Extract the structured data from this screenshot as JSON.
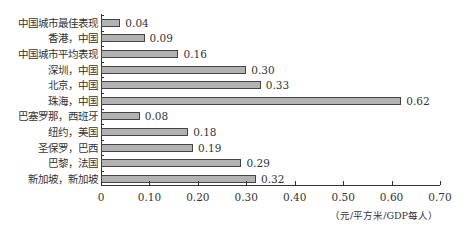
{
  "chart_data": {
    "type": "bar",
    "orientation": "horizontal",
    "title": "",
    "xlabel": "（元/平方米/GDP每人）",
    "ylabel": "",
    "xlim": [
      0,
      0.7
    ],
    "xticks": [
      "0",
      "0.10",
      "0.20",
      "0.30",
      "0.40",
      "0.50",
      "0.60",
      "0.70"
    ],
    "grid": false,
    "legend": null,
    "categories": [
      "中国城市最佳表现",
      "香港，中国",
      "中国城市平均表现",
      "深圳，中国",
      "北京，中国",
      "珠海，中国",
      "巴塞罗那，西班牙",
      "纽约，美国",
      "圣保罗，巴西",
      "巴黎，法国",
      "新加坡，新加坡"
    ],
    "values": [
      0.04,
      0.09,
      0.16,
      0.3,
      0.33,
      0.62,
      0.08,
      0.18,
      0.19,
      0.29,
      0.32
    ],
    "value_labels": [
      "0.04",
      "0.09",
      "0.16",
      "0.30",
      "0.33",
      "0.62",
      "0.08",
      "0.18",
      "0.19",
      "0.29",
      "0.32"
    ],
    "bar_color": "#b2b2b2",
    "bar_border_color": "#444444"
  }
}
